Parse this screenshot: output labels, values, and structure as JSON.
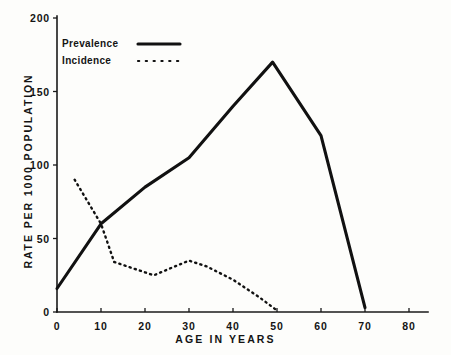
{
  "chart_data": {
    "type": "line",
    "title": "",
    "xlabel": "AGE IN YEARS",
    "ylabel": "RATE PER 1000 POPULATION",
    "xlim": [
      0,
      80
    ],
    "ylim": [
      0,
      200
    ],
    "xticks": [
      0,
      10,
      20,
      30,
      40,
      50,
      60,
      70,
      80
    ],
    "yticks": [
      0,
      50,
      100,
      150,
      200
    ],
    "grid": false,
    "legend_position": "upper-left",
    "series": [
      {
        "name": "Prevalence",
        "style": "solid",
        "color": "#111111",
        "x": [
          0,
          10,
          20,
          30,
          40,
          49,
          60,
          70
        ],
        "values": [
          16,
          60,
          85,
          105,
          140,
          170,
          120,
          3
        ]
      },
      {
        "name": "Incidence",
        "style": "dotted",
        "color": "#111111",
        "x": [
          4,
          10,
          13,
          17,
          22,
          26,
          30,
          34,
          40,
          46,
          50
        ],
        "values": [
          90,
          60,
          34,
          30,
          25,
          30,
          35,
          31,
          22,
          10,
          1
        ]
      }
    ]
  },
  "legend": {
    "items": [
      {
        "label": "Prevalence",
        "style": "solid"
      },
      {
        "label": "Incidence",
        "style": "dotted"
      }
    ]
  },
  "axes": {
    "x_tick_labels": [
      "0",
      "10",
      "20",
      "30",
      "40",
      "50",
      "60",
      "70",
      "80"
    ],
    "y_tick_labels": [
      "0",
      "50",
      "100",
      "150",
      "200"
    ],
    "x_title": "AGE IN YEARS",
    "y_title": "RATE PER 1000 POPULATION"
  }
}
